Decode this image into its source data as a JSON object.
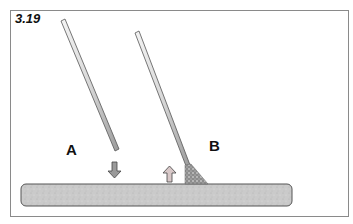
{
  "figure": {
    "number": "3.19",
    "labels": {
      "a": "A",
      "b": "B"
    },
    "elements": {
      "rod_a": "welding-rod-lifted",
      "rod_b": "welding-rod-touching-with-arc",
      "arrow_a": "down-arrow",
      "arrow_b": "up-arrow",
      "plate": "workpiece-plate"
    },
    "colors": {
      "border": "#8a8a8a",
      "rod_fill": "#e6e6e6",
      "rod_outline": "#555555",
      "plate_fill": "#c9c9c9",
      "plate_outline": "#555555",
      "arrow_fill": "#9a9a9a"
    }
  }
}
